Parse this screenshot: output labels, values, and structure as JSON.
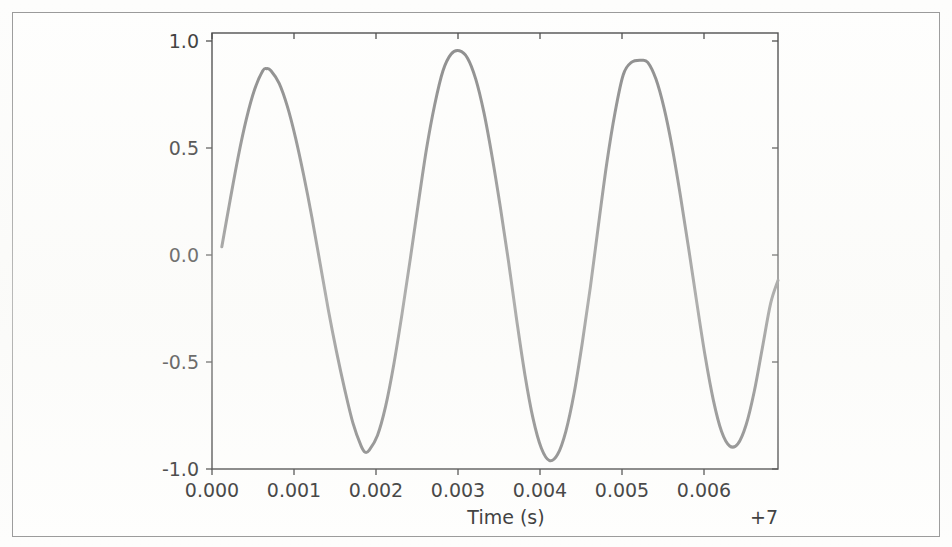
{
  "figure": {
    "background_color": "#fefefd",
    "frame_color": "#9a9a9a"
  },
  "chart_data": {
    "type": "line",
    "title": "",
    "xlabel": "Time (s)",
    "ylabel": "",
    "x_offset_label": "+7",
    "xlim": [
      -0.00012,
      0.00679
    ],
    "ylim": [
      -1.04,
      1.04
    ],
    "xticks": [
      0.0,
      0.001,
      0.002,
      0.003,
      0.004,
      0.005,
      0.006
    ],
    "xticklabels": [
      "0.000",
      "0.001",
      "0.002",
      "0.003",
      "0.004",
      "0.005",
      "0.006"
    ],
    "yticks": [
      1.0,
      0.5,
      0.0,
      -0.5,
      -1.0
    ],
    "yticklabels": [
      "1.0",
      "0.5",
      "0.0",
      "-0.5",
      "-1.0"
    ],
    "grid": false,
    "legend": null,
    "series": [
      {
        "name": "signal",
        "color": "#8a8a8a",
        "linewidth": 3.0,
        "period_s": 0.00225,
        "x": [
          0.0,
          0.0001,
          0.0002,
          0.0003,
          0.0004,
          0.0005,
          0.00055,
          0.0006,
          0.0007,
          0.0008,
          0.0009,
          0.001,
          0.0011,
          0.0012,
          0.0013,
          0.0014,
          0.0015,
          0.0016,
          0.0017,
          0.00175,
          0.0018,
          0.0019,
          0.002,
          0.0021,
          0.0022,
          0.0023,
          0.0024,
          0.0025,
          0.0026,
          0.0027,
          0.0028,
          0.0029,
          0.003,
          0.0031,
          0.0032,
          0.0033,
          0.0034,
          0.0035,
          0.0036,
          0.0037,
          0.0038,
          0.0039,
          0.004,
          0.0041,
          0.0042,
          0.0043,
          0.0044,
          0.0045,
          0.0046,
          0.0047,
          0.0048,
          0.0049,
          0.005,
          0.00512,
          0.0052,
          0.0053,
          0.0054,
          0.0055,
          0.0056,
          0.0057,
          0.0058,
          0.0059,
          0.006,
          0.0061,
          0.0062,
          0.0063,
          0.0064,
          0.0065,
          0.0066,
          0.0067,
          0.00679
        ],
        "y": [
          0.02,
          0.24,
          0.45,
          0.63,
          0.77,
          0.86,
          0.87,
          0.86,
          0.8,
          0.69,
          0.54,
          0.36,
          0.16,
          -0.06,
          -0.28,
          -0.48,
          -0.66,
          -0.82,
          -0.93,
          -0.96,
          -0.95,
          -0.88,
          -0.74,
          -0.54,
          -0.3,
          -0.04,
          0.23,
          0.49,
          0.7,
          0.86,
          0.94,
          0.955,
          0.92,
          0.82,
          0.66,
          0.45,
          0.21,
          -0.05,
          -0.33,
          -0.59,
          -0.8,
          -0.94,
          -1.0,
          -0.97,
          -0.86,
          -0.68,
          -0.44,
          -0.17,
          0.13,
          0.42,
          0.66,
          0.84,
          0.9,
          0.91,
          0.9,
          0.82,
          0.68,
          0.49,
          0.26,
          0.01,
          -0.25,
          -0.5,
          -0.71,
          -0.86,
          -0.93,
          -0.92,
          -0.83,
          -0.67,
          -0.46,
          -0.25,
          -0.14
        ]
      }
    ]
  },
  "axes_geometry": {
    "left_px": 212,
    "right_px": 778,
    "top_px": 33,
    "bottom_px": 469
  }
}
